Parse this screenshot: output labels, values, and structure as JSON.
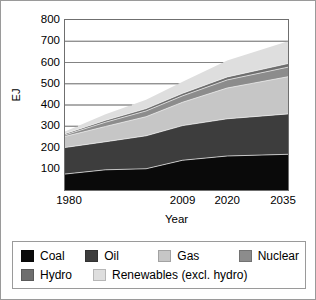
{
  "chart_data": {
    "type": "area",
    "title": "",
    "xlabel": "Year",
    "ylabel": "EJ",
    "stacked": true,
    "grid": true,
    "legend_position": "bottom",
    "x": [
      1980,
      1990,
      2000,
      2009,
      2020,
      2035
    ],
    "xlim": [
      1980,
      2035
    ],
    "ylim": [
      0,
      800
    ],
    "xticks": [
      "1980",
      "2009",
      "2020",
      "2035"
    ],
    "xtick_values": [
      1980,
      2009,
      2020,
      2035
    ],
    "yticks": [
      "100",
      "200",
      "300",
      "400",
      "500",
      "600",
      "700",
      "800"
    ],
    "ytick_values": [
      100,
      200,
      300,
      400,
      500,
      600,
      700,
      800
    ],
    "series": [
      {
        "name": "Coal",
        "color": "#0a0a0a",
        "values": [
          75,
          95,
          100,
          140,
          160,
          168
        ]
      },
      {
        "name": "Oil",
        "color": "#3d3d3d",
        "values": [
          125,
          132,
          155,
          163,
          175,
          190
        ]
      },
      {
        "name": "Gas",
        "color": "#c6c6c6",
        "values": [
          52,
          72,
          90,
          110,
          145,
          175
        ]
      },
      {
        "name": "Nuclear",
        "color": "#8c8c8c",
        "values": [
          7,
          20,
          27,
          30,
          38,
          45
        ]
      },
      {
        "name": "Hydro",
        "color": "#6e6e6e",
        "values": [
          6,
          9,
          11,
          12,
          14,
          17
        ]
      },
      {
        "name": "Renewables (excl. hydro)",
        "color": "#dedede",
        "values": [
          10,
          28,
          42,
          55,
          78,
          105
        ]
      }
    ],
    "totals": [
      275,
      356,
      425,
      510,
      610,
      700
    ]
  },
  "legend": {
    "rows": [
      [
        {
          "label": "Coal",
          "color": "#0a0a0a"
        },
        {
          "label": "Oil",
          "color": "#3d3d3d"
        },
        {
          "label": "Gas",
          "color": "#c6c6c6"
        },
        {
          "label": "Nuclear",
          "color": "#8c8c8c"
        }
      ],
      [
        {
          "label": "Hydro",
          "color": "#6e6e6e"
        },
        {
          "label": "Renewables (excl. hydro)",
          "color": "#dedede"
        }
      ]
    ]
  },
  "style": {
    "frame_color": "#6f6f6f",
    "grid_color": "#7d7d7d",
    "outer_border_color": "#9a9a9a",
    "background": "#ffffff",
    "text_color": "#000000"
  }
}
